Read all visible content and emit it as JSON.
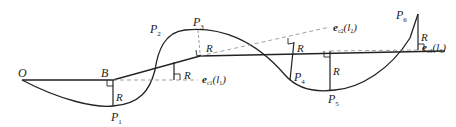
{
  "diagram": {
    "title": "",
    "colors": {
      "stroke": "#222222",
      "dashed": "#888888",
      "background": "#ffffff"
    },
    "points": [
      {
        "id": "O",
        "label": "O",
        "sub": ""
      },
      {
        "id": "B",
        "label": "B",
        "sub": ""
      },
      {
        "id": "P1",
        "label": "P",
        "sub": "1"
      },
      {
        "id": "P2",
        "label": "P",
        "sub": "2"
      },
      {
        "id": "P3",
        "label": "P",
        "sub": "3"
      },
      {
        "id": "P4",
        "label": "P",
        "sub": "4"
      },
      {
        "id": "P5",
        "label": "P",
        "sub": "5"
      },
      {
        "id": "P6",
        "label": "P",
        "sub": "6"
      }
    ],
    "radius_label": "R",
    "vectors": [
      {
        "id": "ec1",
        "symbol": "e",
        "sub": "c1",
        "arg": "(l",
        "arg_sub": "1",
        "close": ")"
      },
      {
        "id": "ec2",
        "symbol": "e",
        "sub": "c2",
        "arg": "(l",
        "arg_sub": "2",
        "close": ")"
      },
      {
        "id": "ec3",
        "symbol": "e",
        "sub": "c3",
        "arg": "(l",
        "arg_sub": "3",
        "close": ")"
      }
    ]
  }
}
